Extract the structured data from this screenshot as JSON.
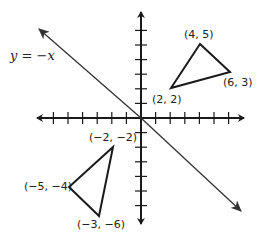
{
  "diagram": {
    "title": "",
    "line_label": "y = −x",
    "colors": {
      "axes": "#1a1a1a",
      "line": "#333333",
      "triangle": "#1a1a1a",
      "text": "#222222",
      "background": "#ffffff"
    },
    "axes": {
      "x_ticks": [
        -6,
        -5,
        -4,
        -3,
        -2,
        -1,
        1,
        2,
        3,
        4,
        5,
        6
      ],
      "y_ticks": [
        -6,
        -5,
        -4,
        -3,
        -2,
        -1,
        1,
        2,
        3,
        4,
        5,
        6
      ]
    },
    "line": {
      "equation": "y = -x"
    },
    "triangles": [
      {
        "name": "original",
        "vertices": [
          {
            "x": 4,
            "y": 5,
            "label": "(4, 5)"
          },
          {
            "x": 6,
            "y": 3,
            "label": "(6, 3)"
          },
          {
            "x": 2,
            "y": 2,
            "label": "(2, 2)"
          }
        ]
      },
      {
        "name": "reflected",
        "vertices": [
          {
            "x": -2,
            "y": -2,
            "label": "(−2, −2)"
          },
          {
            "x": -5,
            "y": -4,
            "label": "(−5, −4)"
          },
          {
            "x": -3,
            "y": -6,
            "label": "(−3, −6)"
          }
        ]
      }
    ]
  }
}
